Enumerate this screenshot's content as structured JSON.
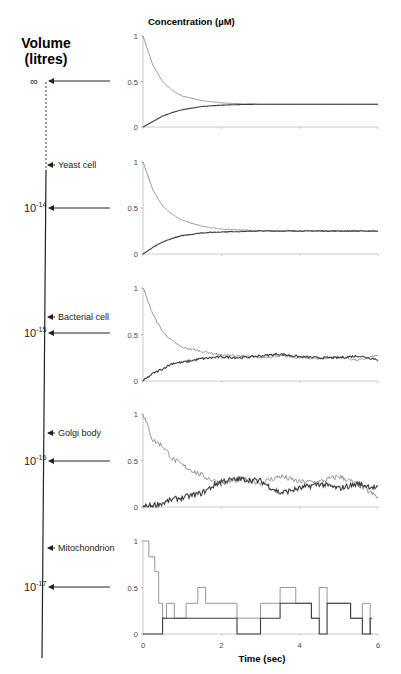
{
  "figure": {
    "left_title_line1": "Volume",
    "left_title_line2": "(litres)",
    "y_axis_title": "Concentration (µM)",
    "x_axis_title": "Time (sec)",
    "volume_levels": [
      {
        "label": "∞",
        "base": "",
        "exp": "",
        "y": 81
      },
      {
        "label": "10",
        "base": "10",
        "exp": "-14",
        "y": 208
      },
      {
        "label": "10",
        "base": "10",
        "exp": "-15",
        "y": 333
      },
      {
        "label": "10",
        "base": "10",
        "exp": "-16",
        "y": 461
      },
      {
        "label": "10",
        "base": "10",
        "exp": "-17",
        "y": 587
      }
    ],
    "organelles": [
      {
        "name": "Yeast cell",
        "y": 165
      },
      {
        "name": "Bacterial cell",
        "y": 317
      },
      {
        "name": "Golgi body",
        "y": 433
      },
      {
        "name": "Mitochondrion",
        "y": 548
      }
    ],
    "colors": {
      "series_a": "#8a8a8a",
      "series_b": "#3a3a3a",
      "axis": "#555555"
    }
  },
  "chart_data": [
    {
      "type": "line",
      "title": "Volume = ∞",
      "xlabel": "",
      "ylabel": "Concentration (µM)",
      "xlim": [
        0,
        6
      ],
      "ylim": [
        0,
        1
      ],
      "yticks": [
        0,
        0.5,
        1
      ],
      "x": [
        0,
        0.25,
        0.5,
        0.75,
        1,
        1.5,
        2,
        2.5,
        3,
        4,
        5,
        6
      ],
      "series": [
        {
          "name": "decaying species",
          "values": [
            1,
            0.68,
            0.5,
            0.4,
            0.34,
            0.29,
            0.265,
            0.255,
            0.25,
            0.25,
            0.25,
            0.25
          ]
        },
        {
          "name": "rising species",
          "values": [
            0,
            0.06,
            0.12,
            0.16,
            0.19,
            0.225,
            0.24,
            0.247,
            0.25,
            0.25,
            0.25,
            0.25
          ]
        }
      ]
    },
    {
      "type": "line",
      "title": "Volume = 1e-14 L (Yeast cell)",
      "xlim": [
        0,
        6
      ],
      "ylim": [
        0,
        1
      ],
      "yticks": [
        0,
        0.5,
        1
      ],
      "x": [
        0,
        0.25,
        0.5,
        0.75,
        1,
        1.5,
        2,
        2.5,
        3,
        4,
        5,
        6
      ],
      "series": [
        {
          "name": "decaying species",
          "values": [
            1,
            0.7,
            0.52,
            0.43,
            0.37,
            0.3,
            0.27,
            0.26,
            0.255,
            0.25,
            0.25,
            0.25
          ]
        },
        {
          "name": "rising species",
          "values": [
            0,
            0.07,
            0.13,
            0.17,
            0.2,
            0.23,
            0.24,
            0.245,
            0.25,
            0.25,
            0.25,
            0.25
          ]
        }
      ]
    },
    {
      "type": "line",
      "title": "Volume = 1e-15 L (Bacterial cell)",
      "xlim": [
        0,
        6
      ],
      "ylim": [
        0,
        1
      ],
      "yticks": [
        0,
        0.5,
        1
      ],
      "x": [
        0,
        0.25,
        0.5,
        0.75,
        1,
        1.5,
        2,
        2.5,
        3,
        3.5,
        4,
        4.5,
        5,
        5.5,
        6
      ],
      "series": [
        {
          "name": "decaying species",
          "values": [
            1,
            0.72,
            0.53,
            0.43,
            0.36,
            0.32,
            0.28,
            0.27,
            0.25,
            0.27,
            0.25,
            0.24,
            0.26,
            0.22,
            0.28
          ]
        },
        {
          "name": "rising species",
          "values": [
            0,
            0.08,
            0.13,
            0.19,
            0.2,
            0.24,
            0.26,
            0.25,
            0.27,
            0.29,
            0.26,
            0.25,
            0.25,
            0.27,
            0.23
          ]
        }
      ]
    },
    {
      "type": "line",
      "title": "Volume = 1e-16 L (Golgi body)",
      "xlim": [
        0,
        6
      ],
      "ylim": [
        0,
        1
      ],
      "yticks": [
        0,
        0.5,
        1
      ],
      "x": [
        0,
        0.25,
        0.5,
        0.75,
        1,
        1.5,
        2,
        2.5,
        3,
        3.5,
        4,
        4.5,
        5,
        5.5,
        6
      ],
      "series": [
        {
          "name": "decaying species",
          "values": [
            1,
            0.72,
            0.66,
            0.52,
            0.45,
            0.34,
            0.25,
            0.3,
            0.26,
            0.33,
            0.27,
            0.27,
            0.33,
            0.24,
            0.1
          ]
        },
        {
          "name": "rising species",
          "values": [
            0,
            0.02,
            0.04,
            0.08,
            0.1,
            0.15,
            0.28,
            0.3,
            0.28,
            0.15,
            0.2,
            0.25,
            0.2,
            0.25,
            0.2
          ]
        }
      ]
    },
    {
      "type": "line",
      "title": "Volume = 1e-17 L (Mitochondrion)",
      "xlabel": "Time (sec)",
      "ylabel": "Concentration (µM)",
      "xlim": [
        0,
        6
      ],
      "ylim": [
        0,
        1
      ],
      "xticks": [
        0,
        2,
        4,
        6
      ],
      "yticks": [
        0,
        0.5,
        1
      ],
      "x": [
        0,
        0.15,
        0.3,
        0.4,
        0.5,
        0.6,
        0.8,
        1.1,
        1.4,
        1.6,
        2,
        2.4,
        3,
        3.5,
        3.9,
        4.3,
        4.5,
        4.7,
        5,
        5.3,
        5.6,
        5.8
      ],
      "series": [
        {
          "name": "decaying species (stochastic)",
          "values": [
            1,
            0.83,
            0.67,
            0.33,
            0.17,
            0.33,
            0.17,
            0.33,
            0.5,
            0.33,
            0.33,
            0.17,
            0.33,
            0.5,
            0.33,
            0.17,
            0.5,
            0.33,
            0.33,
            0.17,
            0.33,
            0.0
          ]
        },
        {
          "name": "rising species (stochastic)",
          "values": [
            0,
            0,
            0,
            0,
            0.17,
            0.17,
            0.17,
            0.17,
            0.17,
            0.17,
            0.17,
            0.0,
            0.17,
            0.33,
            0.33,
            0.17,
            0.0,
            0.33,
            0.33,
            0.17,
            0.0,
            0.17
          ]
        }
      ]
    }
  ]
}
